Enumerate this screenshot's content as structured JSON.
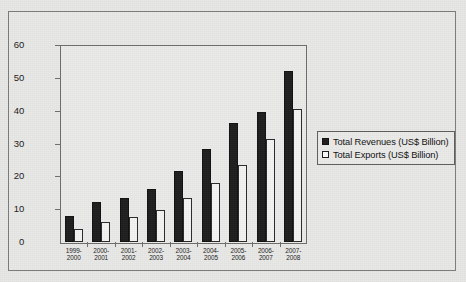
{
  "chart_data": {
    "type": "bar",
    "title": "",
    "xlabel": "",
    "ylabel": "",
    "ylim": [
      0,
      60
    ],
    "yticks": [
      "0",
      "10",
      "20",
      "30",
      "40",
      "50",
      "60"
    ],
    "grid": false,
    "legend_position": "right",
    "categories": [
      "1999-\n2000",
      "2000-\n2001",
      "2001-\n2002",
      "2002-\n2003",
      "2003-\n2004",
      "2004-\n2005",
      "2005-\n2006",
      "2006-\n2007",
      "2007-\n2008"
    ],
    "series": [
      {
        "name": "Total Revenues (US$ Billion)",
        "color": "#1e1e1e",
        "values": [
          8.0,
          12.1,
          13.5,
          16.1,
          21.6,
          28.2,
          36.3,
          39.6,
          52.0
        ]
      },
      {
        "name": "Total Exports (US$ Billion)",
        "color": "#ffffff",
        "values": [
          4.0,
          6.2,
          7.6,
          9.9,
          13.3,
          18.0,
          23.6,
          31.4,
          40.4
        ]
      }
    ]
  },
  "legend": {
    "items": [
      {
        "label": "Total Revenues (US$ Billion)",
        "swatch": "filled-square-icon"
      },
      {
        "label": "Total Exports (US$ Billion)",
        "swatch": "hollow-square-icon"
      }
    ]
  }
}
